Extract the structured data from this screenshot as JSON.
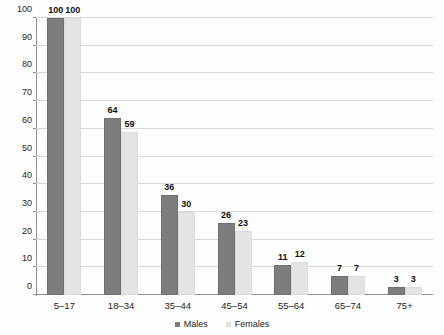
{
  "chart_data": {
    "type": "bar",
    "title": "",
    "subtitle": "",
    "xlabel": "",
    "ylabel": "",
    "ylim": [
      0,
      100
    ],
    "yticks": [
      0,
      10,
      20,
      30,
      40,
      50,
      60,
      70,
      80,
      90,
      100
    ],
    "grid": true,
    "legend_position": "bottom-center",
    "categories": [
      "5–17",
      "18–34",
      "35–44",
      "45–54",
      "55–64",
      "65–74",
      "75+"
    ],
    "series": [
      {
        "name": "Males",
        "color": "#7d7d7d",
        "values": [
          100,
          64,
          36,
          26,
          11,
          7,
          3
        ]
      },
      {
        "name": "Females",
        "color": "#e4e4e4",
        "values": [
          100,
          59,
          30,
          23,
          12,
          7,
          3
        ]
      }
    ]
  },
  "legend": {
    "items": [
      {
        "label": "Males",
        "swatch": "males-swatch-icon"
      },
      {
        "label": "Females",
        "swatch": "females-swatch-icon"
      }
    ]
  }
}
